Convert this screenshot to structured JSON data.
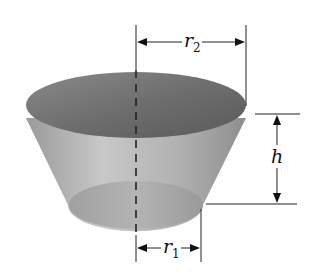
{
  "diagram": {
    "labels": {
      "top_radius": {
        "symbol": "r",
        "subscript": "2"
      },
      "bottom_radius": {
        "symbol": "r",
        "subscript": "1"
      },
      "height": {
        "symbol": "h"
      }
    },
    "colors": {
      "top_face": "#7a7a7a",
      "side": "#b5b5b5",
      "bottom_face": "#a8a8a8",
      "lines": "#222222"
    }
  }
}
